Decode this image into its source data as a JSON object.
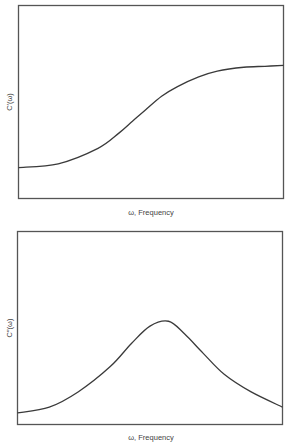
{
  "chart_data": [
    {
      "type": "line",
      "title": "",
      "xlabel": "ω, Frequency",
      "ylabel": "C′(ω)",
      "grid": false,
      "legend": "none",
      "xlim": [
        0,
        1
      ],
      "ylim": [
        0,
        1
      ],
      "x_ticks": [],
      "y_ticks": [],
      "series": [
        {
          "name": "C′(ω)",
          "description": "sigmoidal step rising from low to high plateau",
          "x": [
            0.0,
            0.15,
            0.3,
            0.38,
            0.43,
            0.48,
            0.54,
            0.6,
            0.68,
            0.75,
            0.85,
            0.93,
            1.0
          ],
          "y": [
            0.16,
            0.18,
            0.26,
            0.34,
            0.4,
            0.46,
            0.53,
            0.58,
            0.63,
            0.66,
            0.68,
            0.685,
            0.69
          ]
        }
      ]
    },
    {
      "type": "line",
      "title": "",
      "xlabel": "ω, Frequency",
      "ylabel": "C″(ω)",
      "grid": false,
      "legend": "none",
      "xlim": [
        0,
        1
      ],
      "ylim": [
        0,
        1
      ],
      "x_ticks": [],
      "y_ticks": [],
      "series": [
        {
          "name": "C″(ω)",
          "description": "loss peak (bell-shaped) centered mid-frequency",
          "x": [
            0.0,
            0.12,
            0.23,
            0.35,
            0.43,
            0.5,
            0.57,
            0.63,
            0.7,
            0.78,
            0.88,
            1.0
          ],
          "y": [
            0.06,
            0.09,
            0.17,
            0.3,
            0.42,
            0.51,
            0.535,
            0.47,
            0.37,
            0.26,
            0.17,
            0.09
          ]
        }
      ]
    }
  ]
}
